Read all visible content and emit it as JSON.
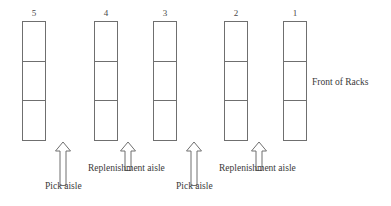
{
  "diagram": {
    "line_color": "#6f6f6f",
    "text_color": "#3a3a3a",
    "background": "#ffffff",
    "front_label": "Front of Racks",
    "racks": [
      {
        "number": "5",
        "cells": 3,
        "x": 22,
        "y": 21,
        "width": 24,
        "height": 120
      },
      {
        "number": "4",
        "cells": 3,
        "x": 94,
        "y": 21,
        "width": 24,
        "height": 120
      },
      {
        "number": "3",
        "cells": 3,
        "x": 153,
        "y": 21,
        "width": 24,
        "height": 120
      },
      {
        "number": "2",
        "cells": 3,
        "x": 224,
        "y": 21,
        "width": 24,
        "height": 120
      },
      {
        "number": "1",
        "cells": 3,
        "x": 283,
        "y": 21,
        "width": 24,
        "height": 120
      }
    ],
    "aisles": [
      {
        "label": "Pick aisle",
        "kind": "pick",
        "arrow_x": 62,
        "arrow_y": 142,
        "arrow_height": 43,
        "label_x": 45,
        "label_y": 186
      },
      {
        "label": "Replenishment aisle",
        "kind": "replenishment",
        "arrow_x": 127,
        "arrow_y": 142,
        "arrow_height": 28,
        "label_x": 88,
        "label_y": 168
      },
      {
        "label": "Pick aisle",
        "kind": "pick",
        "arrow_x": 193,
        "arrow_y": 142,
        "arrow_height": 43,
        "label_x": 176,
        "label_y": 186
      },
      {
        "label": "Replenishment aisle",
        "kind": "replenishment",
        "arrow_x": 258,
        "arrow_y": 142,
        "arrow_height": 28,
        "label_x": 219,
        "label_y": 168
      }
    ],
    "front_label_pos": {
      "x": 303,
      "y": 77
    }
  }
}
